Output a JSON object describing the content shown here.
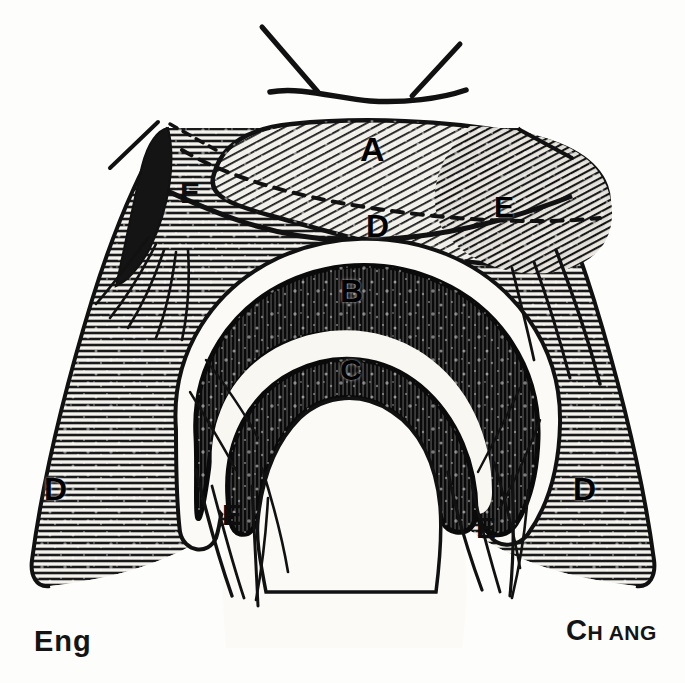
{
  "figure": {
    "background_color": "#fdfdfb",
    "ink_color": "#111111",
    "width": 685,
    "height": 683,
    "labels": [
      {
        "id": "A",
        "text": "A",
        "description": "upper diagonal-hatched band",
        "x": 375,
        "y": 150
      },
      {
        "id": "D-center",
        "text": "D",
        "description": "central horizontal-hatched band",
        "x": 378,
        "y": 228
      },
      {
        "id": "B",
        "text": "B",
        "description": "outer dark arc",
        "x": 352,
        "y": 292
      },
      {
        "id": "C",
        "text": "C",
        "description": "inner dark arc",
        "x": 351,
        "y": 370
      },
      {
        "id": "E-upper-left",
        "text": "E",
        "description": "upper left fibrous band",
        "x": 190,
        "y": 193
      },
      {
        "id": "E-upper-right",
        "text": "E",
        "description": "upper right fibrous band",
        "x": 505,
        "y": 207
      },
      {
        "id": "E-lower-left",
        "text": "E",
        "description": "lower left fibrous band",
        "x": 232,
        "y": 515
      },
      {
        "id": "E-lower-right",
        "text": "E",
        "description": "lower right fibrous band",
        "x": 486,
        "y": 528
      },
      {
        "id": "D-left",
        "text": "D",
        "description": "left horizontal-hatched flank",
        "x": 56,
        "y": 489
      },
      {
        "id": "D-right",
        "text": "D",
        "description": "right horizontal-hatched flank",
        "x": 585,
        "y": 489
      }
    ],
    "signatures": {
      "left": {
        "lead": "E",
        "rest": "ng"
      },
      "right": {
        "lead": "C",
        "small1": "H",
        "mid": " A",
        "small2": "N",
        "rest": "G"
      }
    }
  }
}
